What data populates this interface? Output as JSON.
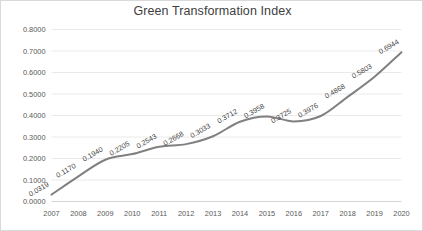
{
  "chart_data": {
    "type": "line",
    "title": "Green Transformation Index",
    "xlabel": "",
    "ylabel": "",
    "categories": [
      "2007",
      "2008",
      "2009",
      "2010",
      "2011",
      "2012",
      "2013",
      "2014",
      "2015",
      "2016",
      "2017",
      "2018",
      "2019",
      "2020"
    ],
    "values": [
      0.0319,
      0.117,
      0.194,
      0.2205,
      0.2543,
      0.2668,
      0.3033,
      0.3712,
      0.3958,
      0.3725,
      0.3976,
      0.4868,
      0.5803,
      0.6944
    ],
    "point_labels": [
      "0.0319",
      "0.1170",
      "0.1940",
      "0.2205",
      "0.2543",
      "0.2668",
      "0.3033",
      "0.3712",
      "0.3958",
      "0.3725",
      "0.3976",
      "0.4868",
      "0.5803",
      "0.6944"
    ],
    "ylim": [
      0.0,
      0.8
    ],
    "ytick_values": [
      0.0,
      0.1,
      0.2,
      0.3,
      0.4,
      0.5,
      0.6,
      0.7,
      0.8
    ],
    "ytick_labels": [
      "0.0000",
      "0.1000",
      "0.2000",
      "0.3000",
      "0.4000",
      "0.5000",
      "0.6000",
      "0.7000",
      "0.8000"
    ],
    "grid": true,
    "grid_axis": "y",
    "legend": false,
    "legend_position": "none",
    "markers": false,
    "data_labels_visible": true,
    "data_label_rotation": -30,
    "series": [
      {
        "name": "Green Transformation Index",
        "values": [
          0.0319,
          0.117,
          0.194,
          0.2205,
          0.2543,
          0.2668,
          0.3033,
          0.3712,
          0.3958,
          0.3725,
          0.3976,
          0.4868,
          0.5803,
          0.6944
        ]
      }
    ]
  },
  "colors": {
    "line": "#808080",
    "gridline": "#e8e8e8",
    "axis": "#d0d0d0",
    "title_text": "#404040",
    "tick_text": "#595959",
    "label_text": "#404040",
    "background": "#ffffff",
    "border": "#d9d9d9"
  }
}
